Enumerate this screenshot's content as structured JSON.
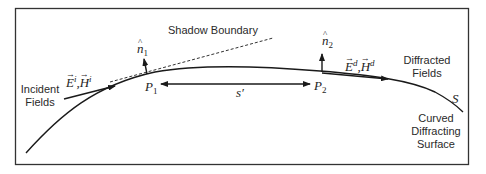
{
  "diagram": {
    "labels": {
      "shadow_boundary": "Shadow Boundary",
      "incident_line1": "Incident",
      "incident_line2": "Fields",
      "diffracted_line1": "Diffracted",
      "diffracted_line2": "Fields",
      "surface_line1": "Curved",
      "surface_line2": "Diffracting",
      "surface_line3": "Surface"
    },
    "symbols": {
      "incident_E": "E",
      "incident_E_sup": "i",
      "incident_H": "H",
      "incident_H_sup": "i",
      "diffracted_E": "E",
      "diffracted_E_sup": "d",
      "diffracted_H": "H",
      "diffracted_H_sup": "d",
      "separator": ",",
      "n1_base": "n",
      "n1_sub": "1",
      "n2_base": "n",
      "n2_sub": "2",
      "p1_base": "P",
      "p1_sub": "1",
      "p2_base": "P",
      "p2_sub": "2",
      "arc_length": "s′",
      "surface": "S"
    },
    "colors": {
      "stroke": "#1a1a1a",
      "frame": "#333333",
      "text": "#2a2a2a"
    }
  }
}
